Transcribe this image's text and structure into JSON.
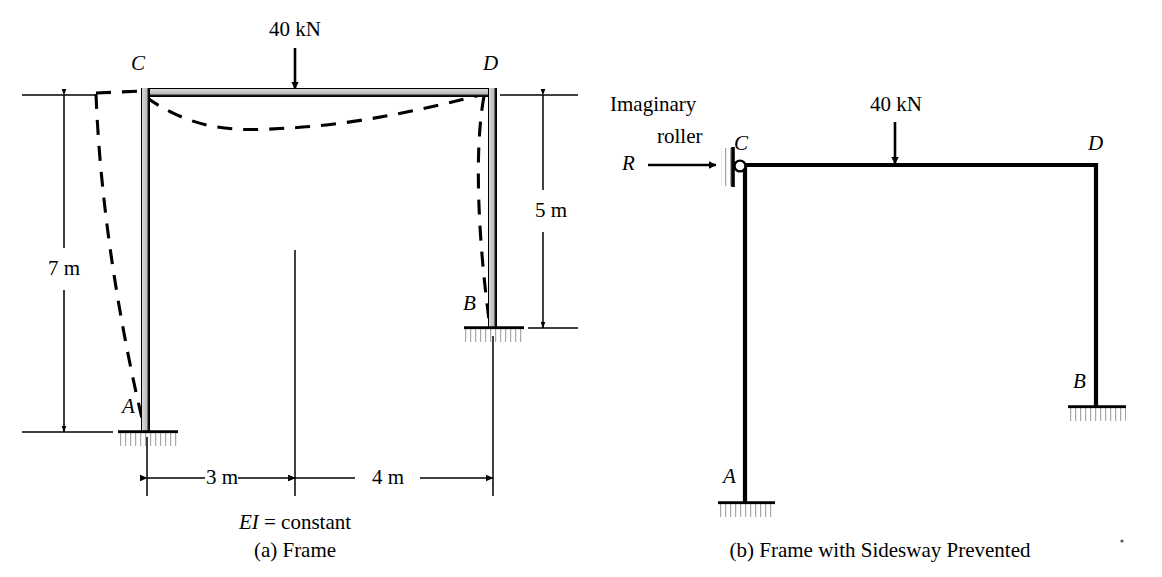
{
  "figure": {
    "colors": {
      "ink": "#000000",
      "member_fill": "#c9c9c9",
      "hatch": "#b5b5b5",
      "background": "#ffffff"
    }
  },
  "panel_a": {
    "caption": "(a) Frame",
    "note": "EI = constant",
    "note_italic_part": "EI",
    "note_rest": " = constant",
    "load": {
      "label": "40 kN",
      "value": 40,
      "unit": "kN",
      "direction": "downward",
      "position_from_C_m": 3
    },
    "nodes": [
      {
        "id": "A",
        "label": "A",
        "type": "fixed-support"
      },
      {
        "id": "B",
        "label": "B",
        "type": "fixed-support"
      },
      {
        "id": "C",
        "label": "C",
        "type": "rigid-joint"
      },
      {
        "id": "D",
        "label": "D",
        "type": "rigid-joint"
      }
    ],
    "dimensions": [
      {
        "label": "7 m",
        "value": 7,
        "unit": "m",
        "member": "column AC",
        "orientation": "vertical",
        "side": "left"
      },
      {
        "label": "5 m",
        "value": 5,
        "unit": "m",
        "member": "column BD",
        "orientation": "vertical",
        "side": "right"
      },
      {
        "label": "3 m",
        "value": 3,
        "unit": "m",
        "member": "beam C to load",
        "orientation": "horizontal"
      },
      {
        "label": "4 m",
        "value": 4,
        "unit": "m",
        "member": "beam load to D",
        "orientation": "horizontal"
      }
    ],
    "deflected_shape": {
      "style": "dashed",
      "description": "sidesway to the left with sagging beam"
    }
  },
  "panel_b": {
    "caption": "(b) Frame with Sidesway Prevented",
    "roller_label_line1": "Imaginary",
    "roller_label_line2": "roller",
    "reaction": {
      "label": "R",
      "direction": "rightward"
    },
    "load": {
      "label": "40 kN",
      "value": 40,
      "unit": "kN",
      "direction": "downward"
    },
    "nodes": [
      {
        "id": "A",
        "label": "A",
        "type": "fixed-support"
      },
      {
        "id": "B",
        "label": "B",
        "type": "fixed-support"
      },
      {
        "id": "C",
        "label": "C",
        "type": "roller-restrained-joint"
      },
      {
        "id": "D",
        "label": "D",
        "type": "rigid-joint"
      }
    ]
  }
}
